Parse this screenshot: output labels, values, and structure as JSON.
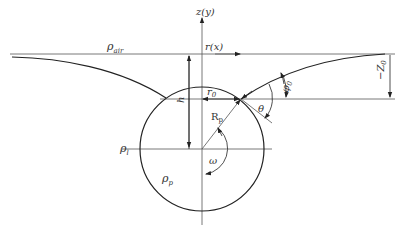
{
  "diagram": {
    "type": "floating sphere at liquid interface (meniscus geometry)",
    "labels": {
      "z_axis": "z(y)",
      "r_axis": "r(x)",
      "rho_air": "ρ",
      "rho_air_sub": "air",
      "rho_liquid": "ρ",
      "rho_liquid_sub": "l",
      "rho_particle": "ρ",
      "rho_particle_sub": "p",
      "r0": "r",
      "r0_sub": "0",
      "Rp": "R",
      "Rp_sub": "p",
      "h": "h",
      "omega": "ω",
      "theta": "θ",
      "phi0": "φ",
      "phi0_sub": "0",
      "Z0": "−Z",
      "Z0_sub": "0"
    },
    "colors": {
      "stroke": "#222222",
      "thin": "#555555",
      "text": "#333333",
      "background": "#ffffff"
    }
  }
}
